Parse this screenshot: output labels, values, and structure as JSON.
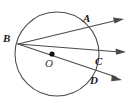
{
  "figure": {
    "type": "circle-geometry-diagram",
    "width": 129,
    "height": 103,
    "background_color": "#ffffff",
    "stroke_color": "#4a4a4a",
    "label_color": "#1a1a1a",
    "circle": {
      "center_label": "O",
      "center_x": 57,
      "center_y": 54,
      "radius": 42
    },
    "center_dot": {
      "x": 52,
      "y": 54,
      "radius": 2.6
    },
    "labels": [
      {
        "name": "A",
        "text": "A",
        "x": 83,
        "y": 13
      },
      {
        "name": "B",
        "text": "B",
        "x": 3,
        "y": 33
      },
      {
        "name": "O",
        "text": "O",
        "x": 45,
        "y": 58
      },
      {
        "name": "C",
        "text": "C",
        "x": 95,
        "y": 56
      },
      {
        "name": "D",
        "text": "D",
        "x": 90,
        "y": 75
      }
    ],
    "vertex": {
      "name": "B",
      "x": 18,
      "y": 44
    },
    "rays": [
      {
        "name": "ray-b-a",
        "through_point": "A",
        "through_x": 90,
        "through_y": 23,
        "tip_x": 124,
        "tip_y": 19
      },
      {
        "name": "ray-b-c",
        "through_point": "C",
        "through_x": 97,
        "through_y": 57,
        "tip_x": 126,
        "tip_y": 52,
        "passes_through_center": true
      },
      {
        "name": "ray-b-d",
        "through_point": "D",
        "through_x": 92,
        "through_y": 74,
        "tip_x": 122,
        "tip_y": 80
      }
    ]
  }
}
